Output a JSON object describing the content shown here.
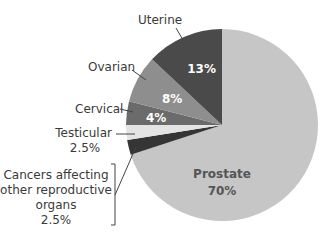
{
  "chart_data": {
    "type": "pie",
    "title": "",
    "start_angle_deg": 0,
    "direction": "clockwise",
    "slices": [
      {
        "label": "Prostate",
        "value": 70,
        "display": "70%",
        "color": "#c6c6c6"
      },
      {
        "label": "Cancers affecting other reproductive organs",
        "value": 2.5,
        "display": "2.5%",
        "color": "#353535"
      },
      {
        "label": "Testicular",
        "value": 2.5,
        "display": "2.5%",
        "color": "#e4e4e4"
      },
      {
        "label": "Cervical",
        "value": 4,
        "display": "4%",
        "color": "#6b6b6b"
      },
      {
        "label": "Ovarian",
        "value": 8,
        "display": "8%",
        "color": "#8e8e8e"
      },
      {
        "label": "Uterine",
        "value": 13,
        "display": "13%",
        "color": "#4a4a4a"
      }
    ]
  },
  "labels": {
    "uterine": "Uterine",
    "uterine_pct": "13%",
    "ovarian": "Ovarian",
    "ovarian_pct": "8%",
    "cervical": "Cervical",
    "cervical_pct": "4%",
    "testicular": "Testicular",
    "testicular_pct": "2.5%",
    "other_line1": "Cancers affecting",
    "other_line2": "other reproductive",
    "other_line3": "organs",
    "other_pct": "2.5%",
    "prostate": "Prostate",
    "prostate_pct": "70%"
  }
}
